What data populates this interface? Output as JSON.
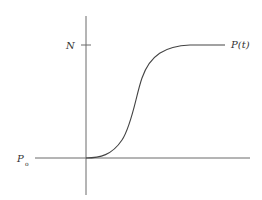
{
  "figure": {
    "colors": {
      "axis": "#6a6a6a",
      "curve": "#444444",
      "text": "#333333",
      "background": "#ffffff"
    }
  },
  "labels": {
    "carrying_capacity": "N",
    "curve_name": "P(t)",
    "initial_main": "P",
    "initial_sub": "o"
  },
  "curve": {
    "type": "logistic",
    "initial_value_label": "P0",
    "asymptote_label": "N",
    "shape": "sigmoid"
  }
}
